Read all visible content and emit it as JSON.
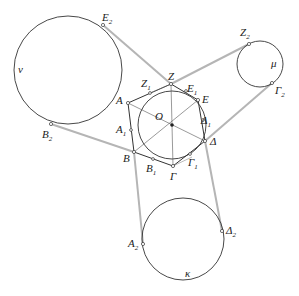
{
  "diagram": {
    "center_label": "O",
    "colors": {
      "stroke": "#333333",
      "tangent_lines": "#b5b5b5",
      "text": "#222222",
      "background": "#ffffff"
    },
    "hexagon_vertices": [
      {
        "id": "A",
        "label": "A",
        "sub": ""
      },
      {
        "id": "B",
        "label": "B",
        "sub": ""
      },
      {
        "id": "G",
        "label": "Γ",
        "sub": ""
      },
      {
        "id": "D",
        "label": "Δ",
        "sub": ""
      },
      {
        "id": "E",
        "label": "E",
        "sub": ""
      },
      {
        "id": "Z",
        "label": "Z",
        "sub": ""
      }
    ],
    "tangent_points": [
      {
        "id": "A1",
        "label": "A",
        "sub": "1"
      },
      {
        "id": "B1",
        "label": "B",
        "sub": "1"
      },
      {
        "id": "G1",
        "label": "Γ",
        "sub": "1"
      },
      {
        "id": "D1",
        "label": "Δ",
        "sub": "1"
      },
      {
        "id": "E1",
        "label": "E",
        "sub": "1"
      },
      {
        "id": "Z1",
        "label": "Z",
        "sub": "1"
      }
    ],
    "outer_circles": [
      {
        "id": "nu",
        "label": "ν"
      },
      {
        "id": "mu",
        "label": "μ"
      },
      {
        "id": "kappa",
        "label": "κ"
      }
    ],
    "outer_points": [
      {
        "id": "E2",
        "label": "E",
        "sub": "2"
      },
      {
        "id": "B2",
        "label": "B",
        "sub": "2"
      },
      {
        "id": "Z2",
        "label": "Z",
        "sub": "2"
      },
      {
        "id": "G2",
        "label": "Γ",
        "sub": "2"
      },
      {
        "id": "A2",
        "label": "A",
        "sub": "2"
      },
      {
        "id": "D2",
        "label": "Δ",
        "sub": "2"
      }
    ]
  }
}
